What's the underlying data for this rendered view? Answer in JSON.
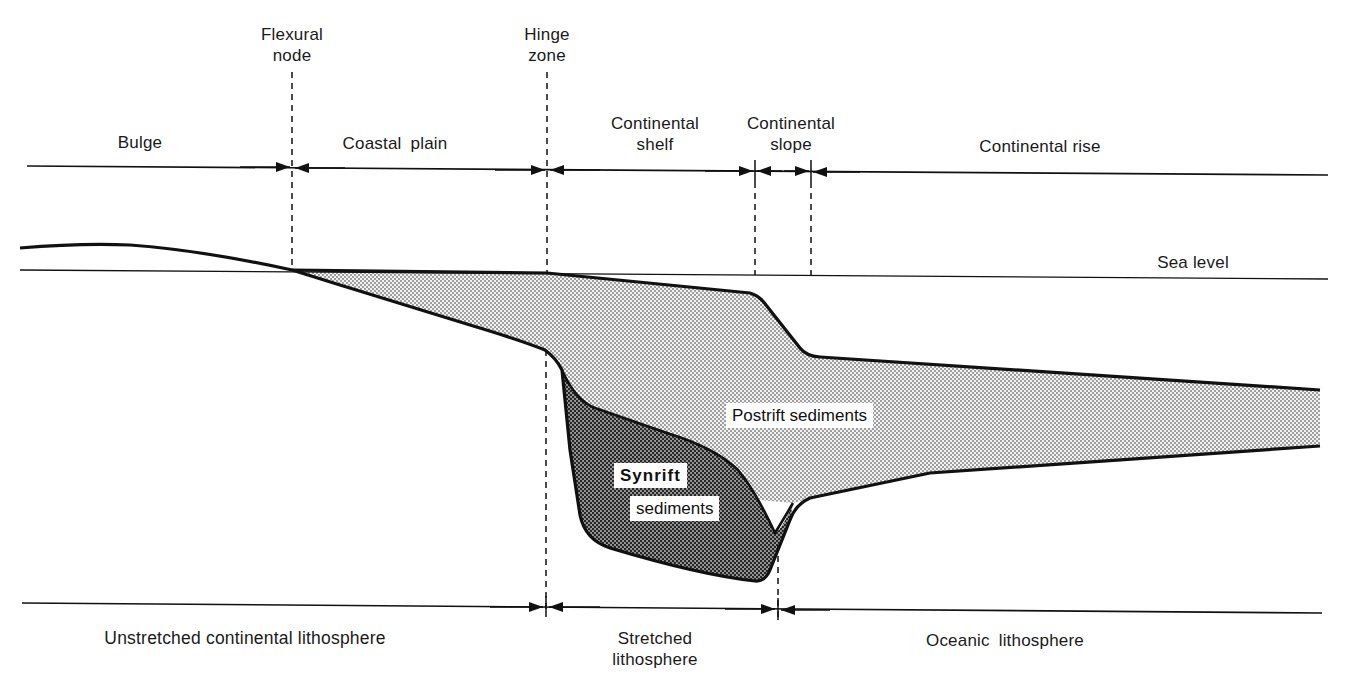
{
  "diagram": {
    "type": "cross-section",
    "top_zones": [
      {
        "label": "Bulge"
      },
      {
        "label": "Coastal plain"
      },
      {
        "label": "Continental shelf"
      },
      {
        "label": "Continental slope"
      },
      {
        "label": "Continental rise"
      }
    ],
    "boundary_markers": [
      {
        "label_line1": "Flexural",
        "label_line2": "node"
      },
      {
        "label_line1": "Hinge",
        "label_line2": "zone"
      }
    ],
    "reference_lines": {
      "sea_level": "Sea level"
    },
    "units": {
      "postrift": "Postrift sediments",
      "synrift_line1": "Synrift",
      "synrift_line2": "sediments"
    },
    "bottom_zones": [
      {
        "label": "Unstretched continental lithosphere"
      },
      {
        "label_line1": "Stretched",
        "label_line2": "lithosphere"
      },
      {
        "label": "Oceanic lithosphere"
      }
    ],
    "colors": {
      "ink": "#111111",
      "postrift_fill": "#d9d9d9",
      "synrift_fill": "#8c8c8c",
      "background": "#ffffff"
    }
  }
}
